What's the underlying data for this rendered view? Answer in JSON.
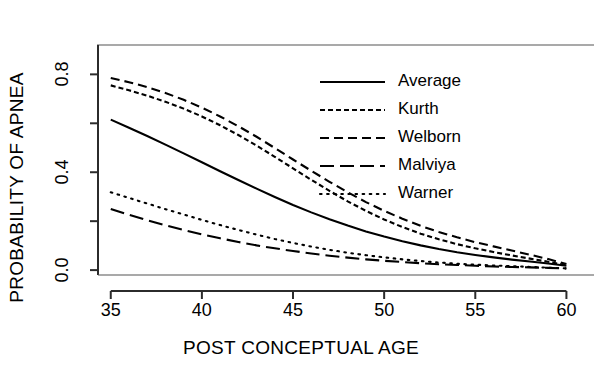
{
  "chart_data": {
    "type": "line",
    "title": "",
    "xlabel": "POST CONCEPTUAL AGE",
    "ylabel": "PROBABILITY OF APNEA",
    "xlim": [
      34.3,
      60.8
    ],
    "ylim": [
      -0.02,
      0.92
    ],
    "grid": false,
    "legend_position": "upper right",
    "xticks": [
      35,
      40,
      45,
      50,
      55,
      60
    ],
    "xtick_labels": [
      "35",
      "40",
      "45",
      "50",
      "55",
      "60"
    ],
    "yticks": [
      0.0,
      0.4,
      0.8
    ],
    "ytick_labels": [
      "0.0",
      "0.4",
      "0.8"
    ],
    "yticks_minor": [
      0.2,
      0.6
    ],
    "x": [
      35,
      36,
      37,
      38,
      39,
      40,
      41,
      42,
      43,
      44,
      45,
      46,
      47,
      48,
      49,
      50,
      51,
      52,
      53,
      54,
      55,
      56,
      57,
      58,
      59,
      60
    ],
    "series": [
      {
        "name": "Average",
        "dash": "solid",
        "values": [
          0.615,
          0.582,
          0.548,
          0.513,
          0.477,
          0.441,
          0.404,
          0.368,
          0.333,
          0.299,
          0.266,
          0.236,
          0.208,
          0.182,
          0.158,
          0.137,
          0.118,
          0.101,
          0.086,
          0.073,
          0.062,
          0.052,
          0.043,
          0.035,
          0.027,
          0.018
        ]
      },
      {
        "name": "Kurth",
        "dash": "short-dash",
        "values": [
          0.755,
          0.735,
          0.713,
          0.688,
          0.66,
          0.628,
          0.592,
          0.552,
          0.509,
          0.463,
          0.416,
          0.369,
          0.324,
          0.281,
          0.242,
          0.207,
          0.176,
          0.149,
          0.126,
          0.106,
          0.089,
          0.074,
          0.06,
          0.047,
          0.034,
          0.02
        ]
      },
      {
        "name": "Welborn",
        "dash": "medium-dash",
        "values": [
          0.785,
          0.768,
          0.748,
          0.724,
          0.696,
          0.664,
          0.628,
          0.588,
          0.545,
          0.499,
          0.452,
          0.406,
          0.361,
          0.318,
          0.278,
          0.242,
          0.21,
          0.181,
          0.156,
          0.134,
          0.114,
          0.097,
          0.08,
          0.063,
          0.045,
          0.025
        ]
      },
      {
        "name": "Malviya",
        "dash": "long-dash",
        "values": [
          0.25,
          0.226,
          0.204,
          0.183,
          0.164,
          0.146,
          0.13,
          0.115,
          0.101,
          0.089,
          0.078,
          0.068,
          0.059,
          0.051,
          0.044,
          0.038,
          0.033,
          0.028,
          0.024,
          0.021,
          0.018,
          0.015,
          0.013,
          0.011,
          0.009,
          0.007
        ]
      },
      {
        "name": "Warner",
        "dash": "dotted",
        "values": [
          0.318,
          0.295,
          0.272,
          0.249,
          0.227,
          0.205,
          0.184,
          0.164,
          0.145,
          0.127,
          0.111,
          0.096,
          0.083,
          0.071,
          0.061,
          0.052,
          0.044,
          0.037,
          0.031,
          0.026,
          0.022,
          0.019,
          0.016,
          0.013,
          0.01,
          0.007
        ]
      }
    ],
    "legend_entries": [
      {
        "label": "Average",
        "dash": "solid"
      },
      {
        "label": "Kurth",
        "dash": "short-dash"
      },
      {
        "label": "Welborn",
        "dash": "medium-dash"
      },
      {
        "label": "Malviya",
        "dash": "long-dash"
      },
      {
        "label": "Warner",
        "dash": "dotted"
      }
    ],
    "line_color": "#000000"
  }
}
